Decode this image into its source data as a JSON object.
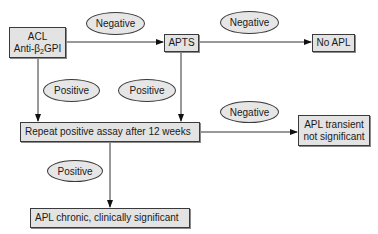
{
  "diagram": {
    "type": "flowchart",
    "nodes": {
      "acl": {
        "line1": "ACL",
        "line2_pre": "Anti-β",
        "line2_sub": "2",
        "line2_post": "GPI"
      },
      "apts": {
        "label": "APTS"
      },
      "no_apl": {
        "label": "No APL"
      },
      "repeat": {
        "label": "Repeat positive assay after 12 weeks"
      },
      "transient": {
        "line1": "APL transient",
        "line2": "not significant"
      },
      "chronic": {
        "label": "APL chronic, clinically significant"
      }
    },
    "edge_labels": {
      "acl_to_apts": "Negative",
      "apts_to_no_apl": "Negative",
      "acl_to_repeat": "Positive",
      "apts_to_repeat": "Positive",
      "repeat_to_transient": "Negative",
      "repeat_to_chronic": "Positive"
    },
    "edges": [
      {
        "from": "ACL Anti-β2GPI",
        "to": "APTS",
        "label": "Negative"
      },
      {
        "from": "APTS",
        "to": "No APL",
        "label": "Negative"
      },
      {
        "from": "ACL Anti-β2GPI",
        "to": "Repeat positive assay after 12 weeks",
        "label": "Positive"
      },
      {
        "from": "APTS",
        "to": "Repeat positive assay after 12 weeks",
        "label": "Positive"
      },
      {
        "from": "Repeat positive assay after 12 weeks",
        "to": "APL transient not significant",
        "label": "Negative"
      },
      {
        "from": "Repeat positive assay after 12 weeks",
        "to": "APL chronic, clinically significant",
        "label": "Positive"
      }
    ],
    "colors": {
      "box_fill": "#e3e3e3",
      "stroke": "#3a3a3a",
      "ellipse_fill": "#e6e6e6"
    }
  }
}
